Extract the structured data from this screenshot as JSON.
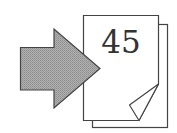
{
  "icon": {
    "name": "go-to-page",
    "page_number": "45"
  },
  "colors": {
    "arrow_fill": "#a3a3a3",
    "arrow_stroke": "#444444",
    "page_fill": "#ffffff",
    "page_stroke": "#444444",
    "text": "#333333"
  }
}
